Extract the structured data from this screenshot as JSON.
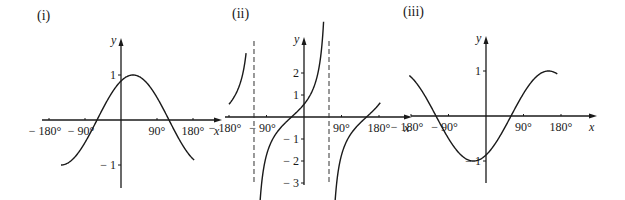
{
  "chart_data": [
    {
      "type": "line",
      "panel_label": "(i)",
      "title": "(i)",
      "function_shape": "cosine wave shifted right by 30°",
      "xlabel": "x",
      "ylabel": "y",
      "xlim": [
        -180,
        180
      ],
      "ylim": [
        -1.5,
        1.5
      ],
      "x_ticks": [
        "− 180°",
        "− 90°",
        "90°",
        "180°"
      ],
      "x_tick_values": [
        -180,
        -90,
        90,
        180
      ],
      "y_ticks": [
        "1",
        "− 1"
      ],
      "y_tick_values": [
        1,
        -1
      ],
      "grid": false,
      "series": [
        {
          "name": "curve",
          "x": [
            -150,
            -120,
            -90,
            -60,
            -30,
            0,
            30,
            60,
            90,
            120,
            150,
            180
          ],
          "y": [
            -1.0,
            -0.87,
            -0.5,
            0.0,
            0.5,
            0.87,
            1.0,
            0.87,
            0.5,
            0.0,
            -0.5,
            -0.87
          ]
        }
      ],
      "asymptotes": []
    },
    {
      "type": "line",
      "panel_label": "(ii)",
      "title": "(ii)",
      "function_shape": "tangent curve shifted left by 30°",
      "xlabel": "x",
      "ylabel": "y",
      "xlim": [
        -180,
        180
      ],
      "ylim": [
        -3,
        3
      ],
      "x_ticks": [
        "− 180°",
        "− 90°",
        "90°",
        "180°"
      ],
      "x_tick_values": [
        -180,
        -90,
        90,
        180
      ],
      "y_ticks": [
        "2",
        "1",
        "− 1",
        "− 2",
        "− 3"
      ],
      "y_tick_values": [
        2,
        1,
        -1,
        -2,
        -3
      ],
      "grid": false,
      "series": [
        {
          "name": "branch-1",
          "x": [
            -180,
            -165,
            -150,
            -140
          ],
          "y": [
            0.58,
            1.0,
            1.73,
            2.75
          ]
        },
        {
          "name": "branch-2",
          "x": [
            -108,
            -90,
            -60,
            -30,
            0,
            30,
            45
          ],
          "y": [
            -3.0,
            -1.73,
            -0.58,
            0.0,
            0.58,
            1.73,
            3.0
          ]
        },
        {
          "name": "branch-3",
          "x": [
            72,
            90,
            120,
            150,
            180
          ],
          "y": [
            -3.0,
            -1.73,
            -0.58,
            0.0,
            0.58
          ]
        }
      ],
      "asymptotes": [
        -120,
        60
      ]
    },
    {
      "type": "line",
      "panel_label": "(iii)",
      "title": "(iii)",
      "function_shape": "sine wave shifted right by 60°",
      "xlabel": "x",
      "ylabel": "y",
      "xlim": [
        -180,
        180
      ],
      "ylim": [
        -1.5,
        1.5
      ],
      "x_ticks": [
        "− 180°",
        "− 90°",
        "90°",
        "180°"
      ],
      "x_tick_values": [
        -180,
        -90,
        90,
        180
      ],
      "y_ticks": [
        "1",
        "− 1"
      ],
      "y_tick_values": [
        1,
        -1
      ],
      "grid": false,
      "series": [
        {
          "name": "curve",
          "x": [
            -180,
            -150,
            -120,
            -90,
            -60,
            -30,
            0,
            30,
            60,
            90,
            120,
            150,
            180
          ],
          "y": [
            0.87,
            0.5,
            0.0,
            -0.5,
            -0.87,
            -1.0,
            -0.87,
            -0.5,
            0.0,
            0.5,
            0.87,
            1.0,
            0.87
          ]
        }
      ],
      "asymptotes": []
    }
  ],
  "panels": [
    {
      "label": "(i)",
      "origin": [
        121,
        120
      ],
      "px_per_deg": 0.4,
      "px_per_unit": 45,
      "x_axis": [
        42,
        218
      ],
      "y_axis": [
        42,
        188
      ],
      "label_pos": [
        37,
        20
      ],
      "fn": "cos",
      "shift": -30,
      "domain": [
        [
          -150,
          183
        ]
      ],
      "asymptotes": [],
      "y_tick_values": [
        1,
        -1
      ],
      "y_tick_labels": [
        "1",
        "− 1"
      ],
      "x_tick_values": [
        -180,
        -90,
        90,
        180
      ],
      "x_tick_labels": [
        "− 180°",
        "− 90°",
        "90°",
        "180°"
      ],
      "x_label": "x",
      "y_label": "y"
    },
    {
      "label": "(ii)",
      "origin": [
        304,
        117
      ],
      "px_per_deg": 0.4167,
      "px_per_unit": 22,
      "x_axis": [
        225,
        408
      ],
      "y_axis": [
        41,
        185
      ],
      "label_pos": [
        232,
        18
      ],
      "fn": "tan",
      "shift": 30,
      "domain": [
        [
          -180,
          -139
        ],
        [
          -107,
          47
        ],
        [
          73,
          183
        ]
      ],
      "asymptotes": [
        -120,
        60
      ],
      "y_tick_values": [
        2,
        1,
        -1,
        -2,
        -3
      ],
      "y_tick_labels": [
        "2",
        "1",
        "− 1",
        "− 2",
        "− 3"
      ],
      "x_tick_values": [
        -180,
        -90,
        90,
        180
      ],
      "x_tick_labels": [
        "− 180°",
        "− 90°",
        "90°",
        "180°"
      ],
      "x_label": "x",
      "y_label": "y"
    },
    {
      "label": "(iii)",
      "origin": [
        486,
        116
      ],
      "px_per_deg": 0.4167,
      "px_per_unit": 45,
      "x_axis": [
        411,
        593
      ],
      "y_axis": [
        40,
        183
      ],
      "label_pos": [
        403,
        16
      ],
      "fn": "sin",
      "shift": -60,
      "domain": [
        [
          -184,
          171
        ]
      ],
      "asymptotes": [],
      "y_tick_values": [
        1,
        -1
      ],
      "y_tick_labels": [
        "1",
        "− 1"
      ],
      "x_tick_values": [
        -180,
        -90,
        90,
        180
      ],
      "x_tick_labels": [
        "− 180°",
        "− 90°",
        "90°",
        "180°"
      ],
      "x_label": "x",
      "y_label": "y"
    }
  ]
}
